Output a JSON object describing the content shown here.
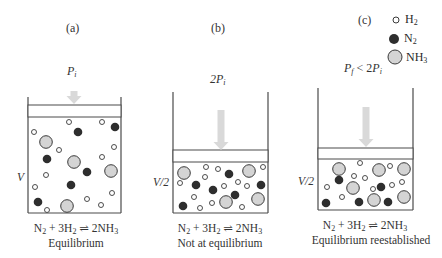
{
  "figure": {
    "colors": {
      "wall": "#4a4a4a",
      "arrow": "#d9d9d9",
      "h2_fill": "#ffffff",
      "h2_stroke": "#3a3a3a",
      "n2_fill": "#2e2e2e",
      "nh3_fill": "#d4d4d4",
      "nh3_stroke": "#3a3a3a"
    },
    "legend": [
      {
        "species": "H",
        "sub": "2",
        "kind": "h2"
      },
      {
        "species": "N",
        "sub": "2",
        "kind": "n2"
      },
      {
        "species": "NH",
        "sub": "3",
        "kind": "nh3"
      }
    ],
    "panels": [
      {
        "id": "a",
        "label": "(a)",
        "pressure": {
          "main": "P",
          "sub": "i",
          "prefix": ""
        },
        "volume_label": "V",
        "equation": {
          "n2": "N",
          "n2_sub": "2",
          "plus": " + 3H",
          "h2_sub": "2",
          "arrow": " ⇌ ",
          "nh3": "2NH",
          "nh3_sub": "3"
        },
        "caption": "Equilibrium",
        "container": {
          "left": 28,
          "right": 121,
          "top": 97,
          "piston_top": 105,
          "piston_bottom": 117,
          "floor": 213
        },
        "arrow": {
          "x": 74,
          "y1": 91,
          "y2": 104
        },
        "molecules": {
          "h2": [
            [
              69,
              122
            ],
            [
              102,
              122
            ],
            [
              34,
              132
            ],
            [
              59,
              150
            ],
            [
              114,
              147
            ],
            [
              102,
              157
            ],
            [
              46,
              175
            ],
            [
              35,
              187
            ],
            [
              112,
              193
            ],
            [
              87,
              199
            ],
            [
              101,
              205
            ],
            [
              47,
              210
            ]
          ],
          "n2": [
            [
              78,
              132
            ],
            [
              115,
              127
            ],
            [
              47,
              159
            ],
            [
              87,
              172
            ],
            [
              71,
              185
            ],
            [
              38,
              202
            ]
          ],
          "nh3": [
            [
              46,
              142
            ],
            [
              74,
              162
            ],
            [
              111,
              171
            ],
            [
              67,
              206
            ]
          ]
        }
      },
      {
        "id": "b",
        "label": "(b)",
        "pressure": {
          "main": "P",
          "sub": "i",
          "prefix": "2"
        },
        "volume_label": "V/2",
        "equation": {
          "n2": "N",
          "n2_sub": "2",
          "plus": " + 3H",
          "h2_sub": "2",
          "arrow": " ⇌ ",
          "nh3": "2NH",
          "nh3_sub": "3"
        },
        "caption": "Not at equilibrium",
        "container": {
          "left": 173,
          "right": 268,
          "top": 92,
          "piston_top": 150,
          "piston_bottom": 162,
          "floor": 213
        },
        "arrow": {
          "x": 221,
          "y1": 110,
          "y2": 150
        },
        "molecules": {
          "h2": [
            [
              206,
              167
            ],
            [
              218,
              169
            ],
            [
              263,
              167
            ],
            [
              180,
              183
            ],
            [
              205,
              177
            ],
            [
              224,
              186
            ],
            [
              238,
              182
            ],
            [
              247,
              186
            ],
            [
              194,
              197
            ],
            [
              212,
              203
            ],
            [
              200,
              208
            ],
            [
              242,
              207
            ]
          ],
          "n2": [
            [
              229,
              174
            ],
            [
              196,
              185
            ],
            [
              213,
              190
            ],
            [
              235,
              195
            ],
            [
              261,
              185
            ],
            [
              183,
              206
            ]
          ],
          "nh3": [
            [
              184,
              173
            ],
            [
              249,
              171
            ],
            [
              226,
              202
            ],
            [
              258,
              199
            ]
          ]
        }
      },
      {
        "id": "c",
        "label": "(c)",
        "pressure": {
          "main": "P",
          "sub": "f",
          "prefix": "",
          "suffix": " < 2",
          "suffix_main": "P",
          "suffix_sub": "i"
        },
        "volume_label": "V/2",
        "equation": {
          "n2": "N",
          "n2_sub": "2",
          "plus": " + 3H",
          "h2_sub": "2",
          "arrow": " ⇌ ",
          "nh3": "2NH",
          "nh3_sub": "3"
        },
        "caption": "Equilibrium reestablished",
        "container": {
          "left": 318,
          "right": 413,
          "top": 88,
          "piston_top": 148,
          "piston_bottom": 159,
          "floor": 210
        },
        "arrow": {
          "x": 366,
          "y1": 107,
          "y2": 147
        },
        "molecules": {
          "h2": [
            [
              360,
              163
            ],
            [
              390,
              166
            ],
            [
              354,
              176
            ],
            [
              365,
              178
            ],
            [
              327,
              187
            ],
            [
              373,
              189
            ],
            [
              392,
              185
            ],
            [
              402,
              182
            ],
            [
              342,
              197
            ]
          ],
          "n2": [
            [
              339,
              180
            ],
            [
              381,
              187
            ],
            [
              326,
              203
            ],
            [
              359,
              202
            ],
            [
              388,
              202
            ]
          ],
          "nh3": [
            [
              339,
              169
            ],
            [
              379,
              170
            ],
            [
              404,
              169
            ],
            [
              353,
              188
            ],
            [
              374,
              200
            ],
            [
              404,
              197
            ]
          ]
        }
      }
    ]
  }
}
